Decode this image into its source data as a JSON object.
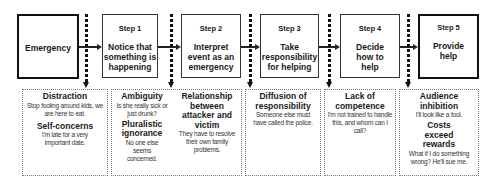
{
  "diagram": {
    "start": {
      "label": "Emergency"
    },
    "steps": [
      {
        "step": "Step 1",
        "text": "Notice that something is happening"
      },
      {
        "step": "Step 2",
        "text": "Interpret event as an emergency"
      },
      {
        "step": "Step 3",
        "text": "Take responsibility for helping"
      },
      {
        "step": "Step 4",
        "text": "Decide how to help"
      },
      {
        "step": "Step 5",
        "text": "Provide help"
      }
    ],
    "barriers": {
      "box1": {
        "items": [
          {
            "title": "Distraction",
            "example": "Stop fooling around kids, we are here to eat."
          },
          {
            "title": "Self-concerns",
            "example": "I'm late for a very important date."
          }
        ]
      },
      "box2": {
        "left": [
          {
            "title": "Ambiguity",
            "example": "Is she really sick or just drunk?"
          },
          {
            "title": "Pluralistic ignorance",
            "example": "No one else seems concerned."
          }
        ],
        "right": [
          {
            "title": "Relationship between attacker and victim",
            "example": "They have to resolve their own family problems."
          }
        ]
      },
      "box3": {
        "items": [
          {
            "title": "Diffusion of responsibility",
            "example": "Someone else must have called the police."
          }
        ]
      },
      "box4": {
        "items": [
          {
            "title": "Lack of competence",
            "example": "I'm not trained to handle this, and whom can I call?"
          }
        ]
      },
      "box5": {
        "items": [
          {
            "title": "Audience inhibition",
            "example": "I'll look like a fool."
          },
          {
            "title": "Costs exceed rewards",
            "example": "What if I do something wrong? He'll sue me."
          }
        ]
      }
    }
  }
}
